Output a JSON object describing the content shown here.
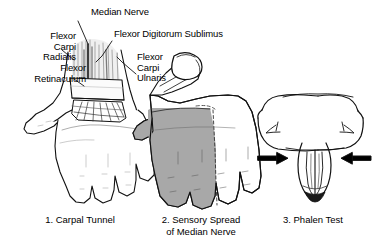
{
  "figure": {
    "background_color": "#ffffff",
    "ink_color": "#000000",
    "shade_color": "#a8a8a8",
    "width": 379,
    "height": 248
  },
  "labels": {
    "median_nerve": "Median Nerve",
    "flexor_digitorum_sublimus": "Flexor Digitorum Sublimus",
    "flexor_carpi_radialis": "Flexor\nCarpi\nRadialis",
    "flexor_retinaculum": "Flexor\nRetinaculum",
    "flexor_carpi_ulnaris": "Flexor\nCarpi\nUlnaris"
  },
  "captions": {
    "panel1": "1. Carpal Tunnel",
    "panel2": "2. Sensory Spread\nof Median Nerve",
    "panel3": "3. Phalen Test"
  },
  "panels": [
    {
      "number": "1",
      "name": "carpal-tunnel",
      "caption": "1. Carpal Tunnel",
      "description": "Palmar view of left hand with wrist dissected showing flexor tendons, median nerve and the flexor retinaculum band crossing the carpal tunnel."
    },
    {
      "number": "2",
      "name": "sensory-spread",
      "caption": "2. Sensory Spread of Median Nerve",
      "description": "Palmar view of hand with grey shading over thumb, index finger, middle finger and radial half of ring finger indicating median nerve sensory distribution.",
      "shaded_digits": [
        "thumb",
        "index",
        "middle",
        "radial half of ring"
      ]
    },
    {
      "number": "3",
      "name": "phalen-test",
      "caption": "3. Phalen Test",
      "description": "Both forearms held with dorsal surfaces of hands pressed together, wrists flexed; two arrows point inward indicating pressing direction.",
      "arrows": [
        "left-arrow-pointing-right",
        "right-arrow-pointing-left"
      ]
    }
  ]
}
